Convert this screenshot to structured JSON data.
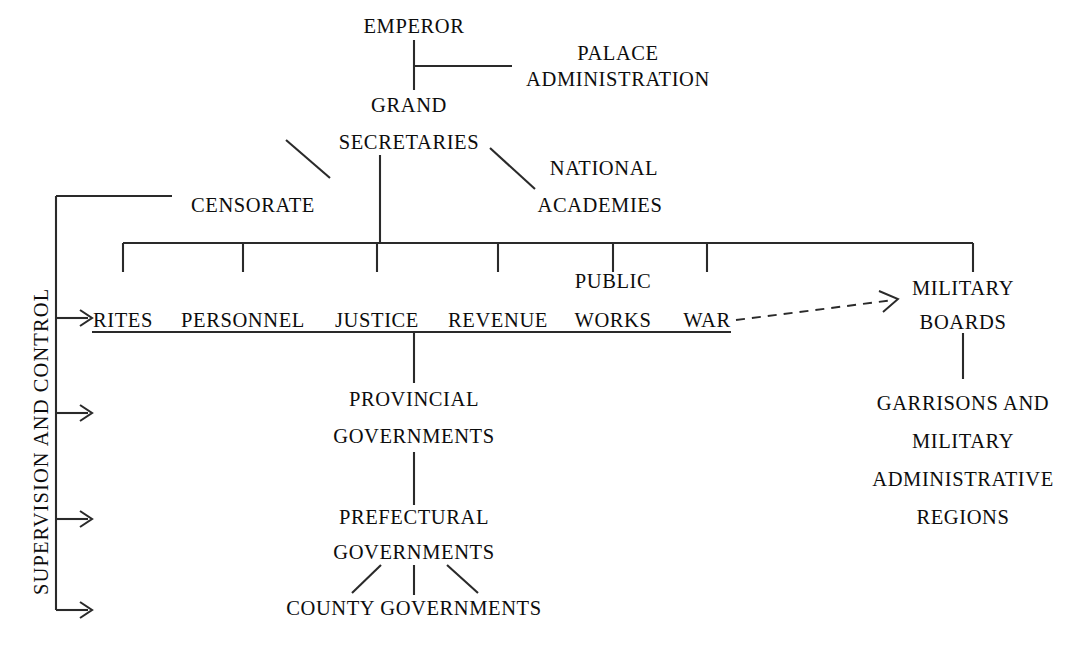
{
  "diagram": {
    "type": "organization-chart",
    "title": "",
    "background_color": "#ffffff",
    "line_color": "#2a2a2a",
    "text_color": "#0d0d0d",
    "side_label": "SUPERVISION AND CONTROL",
    "nodes": {
      "emperor": "EMPEROR",
      "palace_administration_line1": "PALACE",
      "palace_administration_line2": "ADMINISTRATION",
      "grand_secretaries_line1": "GRAND",
      "grand_secretaries_line2": "SECRETARIES",
      "censorate": "CENSORATE",
      "national_academies_line1": "NATIONAL",
      "national_academies_line2": "ACADEMIES",
      "public_works_upper": "PUBLIC",
      "military_boards_line1": "MILITARY",
      "military_boards_line2": "BOARDS",
      "garrisons_line1": "GARRISONS AND",
      "garrisons_line2": "MILITARY",
      "garrisons_line3": "ADMINISTRATIVE",
      "garrisons_line4": "REGIONS",
      "provincial_line1": "PROVINCIAL",
      "provincial_line2": "GOVERNMENTS",
      "prefectural_line1": "PREFECTURAL",
      "prefectural_line2": "GOVERNMENTS",
      "county": "COUNTY GOVERNMENTS"
    },
    "boards": [
      {
        "label": "RITES",
        "x": 123
      },
      {
        "label": "PERSONNEL",
        "x": 243
      },
      {
        "label": "JUSTICE",
        "x": 377
      },
      {
        "label": "REVENUE",
        "x": 498
      },
      {
        "label": "WORKS",
        "x": 613
      },
      {
        "label": "WAR",
        "x": 707
      }
    ],
    "arrow_count": 4
  }
}
